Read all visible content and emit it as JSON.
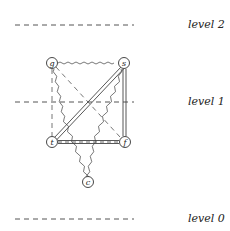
{
  "levels": [
    {
      "label": "level 2",
      "y": 25
    },
    {
      "label": "level 1",
      "y": 102
    },
    {
      "label": "level 0",
      "y": 219
    }
  ],
  "nodes": [
    {
      "id": "g",
      "label": "g",
      "x": 52,
      "y": 63
    },
    {
      "id": "s",
      "label": "s",
      "x": 124,
      "y": 63
    },
    {
      "id": "t",
      "label": "t",
      "x": 52,
      "y": 142
    },
    {
      "id": "f",
      "label": "f",
      "x": 125,
      "y": 142
    },
    {
      "id": "c",
      "label": "c",
      "x": 88,
      "y": 182
    }
  ],
  "edges": [
    {
      "from": "g",
      "to": "s",
      "style": "wavy"
    },
    {
      "from": "g",
      "to": "t",
      "style": "dashed"
    },
    {
      "from": "g",
      "to": "f",
      "style": "dashed"
    },
    {
      "from": "s",
      "to": "t",
      "style": "double"
    },
    {
      "from": "s",
      "to": "f",
      "style": "double"
    },
    {
      "from": "t",
      "to": "f",
      "style": "double-dashed"
    },
    {
      "from": "g",
      "to": "c",
      "style": "wavy"
    },
    {
      "from": "s",
      "to": "c",
      "style": "wavy"
    }
  ],
  "colors": {
    "line": "#444444",
    "text": "#222222"
  }
}
